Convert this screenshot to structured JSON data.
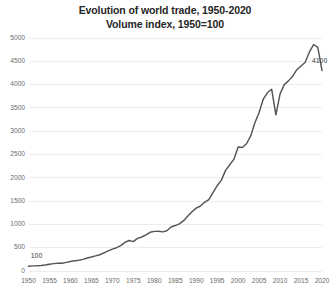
{
  "chart_data": {
    "type": "line",
    "title": "Evolution of world trade, 1950-2020",
    "subtitle": "Volume index, 1950=100",
    "xlabel": "",
    "ylabel": "",
    "xlim": [
      1950,
      2020
    ],
    "ylim": [
      0,
      5000
    ],
    "ytick_step": 500,
    "xtick_step": 5,
    "grid": true,
    "legend": "none",
    "line_color": "#555555",
    "yticks": [
      0,
      500,
      1000,
      1500,
      2000,
      2500,
      3000,
      3500,
      4000,
      4500,
      5000
    ],
    "ytick_labels": [
      "0",
      "500",
      "1000",
      "1500",
      "2000",
      "2500",
      "3000",
      "3500",
      "4000",
      "4500",
      "5000"
    ],
    "xticks": [
      1950,
      1955,
      1960,
      1965,
      1970,
      1975,
      1980,
      1985,
      1990,
      1995,
      2000,
      2005,
      2010,
      2015,
      2020
    ],
    "xtick_labels": [
      "1950",
      "1955",
      "1960",
      "1965",
      "1970",
      "1975",
      "1980",
      "1985",
      "1990",
      "1995",
      "2000",
      "2005",
      "2010",
      "2015",
      "2020"
    ],
    "annotations": [
      {
        "text": "100",
        "x": 1950,
        "y": 100,
        "dx": 8,
        "dy": -8
      },
      {
        "text": "4100",
        "x": 2018,
        "y": 4280,
        "dx": 6,
        "dy": -9
      }
    ],
    "x": [
      1950,
      1951,
      1952,
      1953,
      1954,
      1955,
      1956,
      1957,
      1958,
      1959,
      1960,
      1961,
      1962,
      1963,
      1964,
      1965,
      1966,
      1967,
      1968,
      1969,
      1970,
      1971,
      1972,
      1973,
      1974,
      1975,
      1976,
      1977,
      1978,
      1979,
      1980,
      1981,
      1982,
      1983,
      1984,
      1985,
      1986,
      1987,
      1988,
      1989,
      1990,
      1991,
      1992,
      1993,
      1994,
      1995,
      1996,
      1997,
      1998,
      1999,
      2000,
      2001,
      2002,
      2003,
      2004,
      2005,
      2006,
      2007,
      2008,
      2009,
      2010,
      2011,
      2012,
      2013,
      2014,
      2015,
      2016,
      2017,
      2018,
      2019,
      2020
    ],
    "values": [
      100,
      110,
      112,
      120,
      130,
      145,
      158,
      168,
      168,
      185,
      205,
      218,
      232,
      250,
      278,
      300,
      325,
      348,
      390,
      430,
      470,
      500,
      545,
      615,
      655,
      630,
      700,
      730,
      775,
      830,
      850,
      855,
      840,
      865,
      945,
      975,
      1010,
      1080,
      1180,
      1270,
      1350,
      1395,
      1475,
      1530,
      1680,
      1830,
      1950,
      2160,
      2280,
      2400,
      2660,
      2650,
      2730,
      2900,
      3180,
      3400,
      3690,
      3830,
      3900,
      3350,
      3800,
      4000,
      4080,
      4180,
      4320,
      4400,
      4480,
      4700,
      4860,
      4800,
      4300
    ],
    "series_name": "World trade volume index"
  }
}
